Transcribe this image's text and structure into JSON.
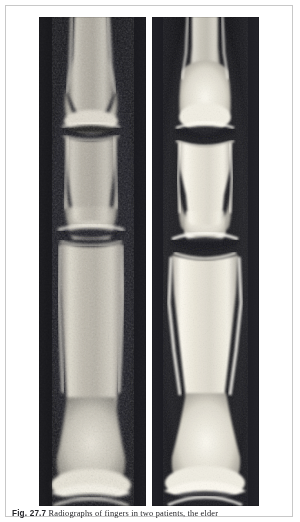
{
  "page": {
    "width": 300,
    "height": 522,
    "background_color": "#ffffff",
    "frame_color": "#c8c8c8"
  },
  "figure": {
    "name": "finger-radiograph-pair",
    "panel_count": 2,
    "panels": [
      {
        "id": "left-radiograph",
        "position": "left",
        "modality": "radiograph",
        "anatomy": "finger phalanges",
        "background_color": "#0d0d10",
        "bone_color": "#d9d6cd",
        "appearance": "coarse mottled trabecular bone, lower contrast, moth-eaten cortical margins",
        "joints_visible": 2,
        "joint_labels": [
          "distal interphalangeal joint",
          "proximal interphalangeal joint"
        ]
      },
      {
        "id": "right-radiograph",
        "position": "right",
        "modality": "radiograph",
        "anatomy": "finger phalanges",
        "background_color": "#16161a",
        "bone_color": "#efece2",
        "appearance": "bright dense cortical bone, higher contrast, smooth well-defined margins",
        "joints_visible": 2,
        "joint_labels": [
          "distal interphalangeal joint",
          "proximal interphalangeal joint"
        ]
      }
    ]
  },
  "caption": {
    "figure_label": "Fig. 27.7",
    "text": "Radiographs of fingers in two patients, the elder"
  }
}
